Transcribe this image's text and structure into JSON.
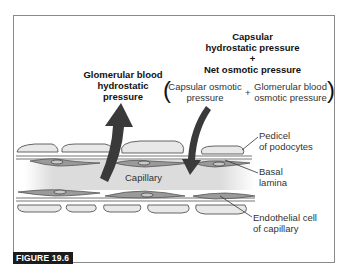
{
  "figure": {
    "label": "FIGURE 19.6",
    "colors": {
      "arrow": "#3a3a3a",
      "cell_fill": "#e6e6e6",
      "cell_stroke": "#555555",
      "endothelial": "#8a8a8a",
      "capillary": "#d9d9d9",
      "label_bg": "#1c1c1c"
    }
  },
  "labels": {
    "glomerular_hydrostatic": [
      "Glomerular blood",
      "hydrostatic",
      "pressure"
    ],
    "capsular_hydrostatic": [
      "Capsular",
      "hydrostatic pressure"
    ],
    "plus_1": "+",
    "net_osmotic": "Net osmotic pressure",
    "capsular_osmotic": [
      "Capsular osmotic",
      "pressure"
    ],
    "plus_2": "+",
    "glomerular_osmotic": [
      "Glomerular blood",
      "osmotic pressure"
    ],
    "paren_open": "(",
    "paren_close": ")",
    "capillary": "Capillary",
    "pedicel": [
      "Pedicel",
      "of podocytes"
    ],
    "basal_lamina": [
      "Basal",
      "lamina"
    ],
    "endothelial": [
      "Endothelial cell",
      "of capillary"
    ]
  }
}
